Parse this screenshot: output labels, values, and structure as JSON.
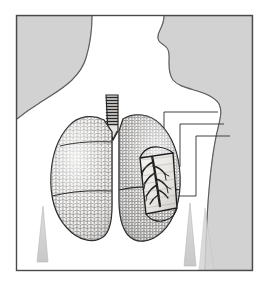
{
  "figure": {
    "title": "Human Lungs in Thorax",
    "style": "engraved line illustration with stipple shading",
    "frame": {
      "visible": true,
      "stroke": "#4a4a4a",
      "x": 16,
      "y": 15,
      "width": 237,
      "height": 256
    }
  },
  "palette": {
    "page_background": "#ffffff",
    "silhouette_gray": "#d2d2d2",
    "silhouette_gray_edge": "#b9b9b9",
    "body_white": "#fefefe",
    "outline_dark": "#2b2b2b",
    "lung_fill": "#f2f0ee",
    "lung_stipple": "#4b4b4b",
    "trachea_fill": "#e8e5e2",
    "trachea_ring": "#262626",
    "inset_fill": "#ecebe8",
    "bronchi_ink": "#1f1f1f",
    "leader_line": "#3a3a3a",
    "wedge_gray": "#cfcfcf"
  },
  "parts": [
    {
      "id": "background-field",
      "label": "Gray background field",
      "interactable": false
    },
    {
      "id": "torso-silhouette",
      "label": "Head, neck and torso profile",
      "interactable": false
    },
    {
      "id": "trachea",
      "label": "Trachea",
      "interactable": false
    },
    {
      "id": "right-lung",
      "label": "Right lung",
      "interactable": false
    },
    {
      "id": "left-lung",
      "label": "Left lung",
      "interactable": false
    },
    {
      "id": "oblique-fissure",
      "label": "Oblique fissure",
      "interactable": false
    },
    {
      "id": "horizontal-fissure",
      "label": "Horizontal fissure",
      "interactable": false
    },
    {
      "id": "cutaway-inset",
      "label": "Cutaway window",
      "interactable": false
    },
    {
      "id": "bronchial-tree",
      "label": "Bronchial tree",
      "interactable": false
    },
    {
      "id": "leader-lines",
      "label": "Callout leader lines",
      "interactable": false
    },
    {
      "id": "axilla-wedges",
      "label": "Axillary shadow wedges",
      "interactable": false
    }
  ],
  "leader_lines": {
    "count": 3,
    "shape": "stepped bracket",
    "direction": "right",
    "labels_visible": false
  },
  "text_content": {
    "visible_text": "",
    "note": "No text or labels are rendered within the image area."
  }
}
